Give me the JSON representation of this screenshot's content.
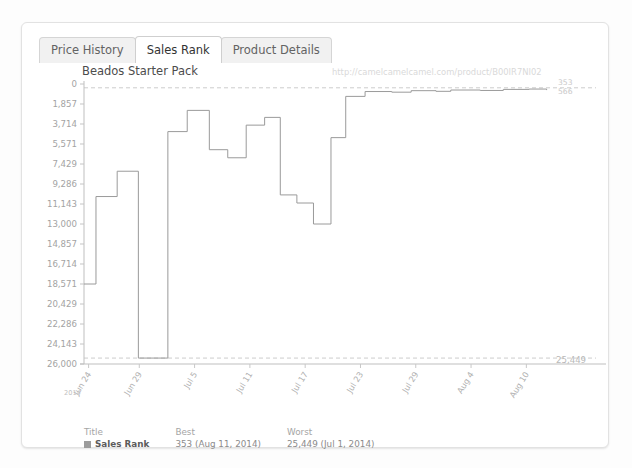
{
  "tabs": [
    {
      "label": "Price History",
      "active": false
    },
    {
      "label": "Sales Rank",
      "active": true
    },
    {
      "label": "Product Details",
      "active": false
    }
  ],
  "watermark": "http://camelcamelcamel.com/product/B00IR7NI02",
  "edge_labels": {
    "top_best": "353",
    "top_current": "566",
    "bottom_worst": "25,449"
  },
  "legend": {
    "headers": [
      "Title",
      "Best",
      "Worst"
    ],
    "rows": [
      {
        "title": "Sales Rank",
        "best": "353 (Aug 11, 2014)",
        "worst": "25,449 (Jul 1, 2014)",
        "color": "#9c9c9c"
      }
    ]
  },
  "axis_year": "2014",
  "chart_data": {
    "type": "line",
    "subtype": "step",
    "title": "Beados Starter Pack",
    "xlabel": "",
    "ylabel": "",
    "grid": false,
    "legend_position": "bottom-left",
    "line_color": "#9a9a9a",
    "reference_lines": [
      {
        "label": "353",
        "value": 353,
        "style": "dashed"
      },
      {
        "label": "25,449",
        "value": 25449,
        "style": "dashed"
      }
    ],
    "ylim": [
      0,
      26000
    ],
    "yticks": [
      0,
      1857,
      3714,
      5571,
      7429,
      9286,
      11143,
      13000,
      14857,
      16714,
      18571,
      20429,
      22286,
      24143,
      26000
    ],
    "yticklabels": [
      "0",
      "1,857",
      "3,714",
      "5,571",
      "7,429",
      "9,286",
      "11,143",
      "13,000",
      "14,857",
      "16,714",
      "18,571",
      "20,429",
      "22,286",
      "24,143",
      "26,000"
    ],
    "xticklabels": [
      "Jun 24",
      "Jun 29",
      "Jul 5",
      "Jul 11",
      "Jul 17",
      "Jul 23",
      "Jul 29",
      "Aug 4",
      "Aug 10"
    ],
    "xtick_positions": [
      0.5,
      6.0,
      12.0,
      18.0,
      24.0,
      30.0,
      36.0,
      42.0,
      48.0
    ],
    "xlim": [
      0,
      51
    ],
    "series": [
      {
        "name": "Sales Rank",
        "points": [
          [
            0.0,
            18571
          ],
          [
            1.3,
            18571
          ],
          [
            1.3,
            10450
          ],
          [
            3.6,
            10450
          ],
          [
            3.6,
            8100
          ],
          [
            5.9,
            8100
          ],
          [
            5.9,
            25449
          ],
          [
            9.1,
            25449
          ],
          [
            9.1,
            4420
          ],
          [
            11.2,
            4420
          ],
          [
            11.2,
            2450
          ],
          [
            13.6,
            2450
          ],
          [
            13.6,
            6100
          ],
          [
            15.6,
            6100
          ],
          [
            15.6,
            6850
          ],
          [
            17.6,
            6850
          ],
          [
            17.6,
            3820
          ],
          [
            19.6,
            3820
          ],
          [
            19.6,
            3100
          ],
          [
            21.3,
            3100
          ],
          [
            21.3,
            10300
          ],
          [
            23.1,
            10300
          ],
          [
            23.1,
            11050
          ],
          [
            24.9,
            11050
          ],
          [
            24.9,
            13000
          ],
          [
            26.8,
            13000
          ],
          [
            26.8,
            4980
          ],
          [
            28.4,
            4980
          ],
          [
            28.4,
            1150
          ],
          [
            30.5,
            1150
          ],
          [
            30.5,
            700
          ],
          [
            33.4,
            700
          ],
          [
            33.4,
            760
          ],
          [
            35.5,
            760
          ],
          [
            35.5,
            620
          ],
          [
            38.2,
            620
          ],
          [
            38.2,
            680
          ],
          [
            39.8,
            680
          ],
          [
            39.8,
            560
          ],
          [
            43.0,
            560
          ],
          [
            43.0,
            600
          ],
          [
            45.5,
            600
          ],
          [
            45.5,
            500
          ],
          [
            48.3,
            500
          ],
          [
            48.3,
            470
          ],
          [
            50.2,
            470
          ],
          [
            50.2,
            566
          ]
        ]
      }
    ]
  }
}
